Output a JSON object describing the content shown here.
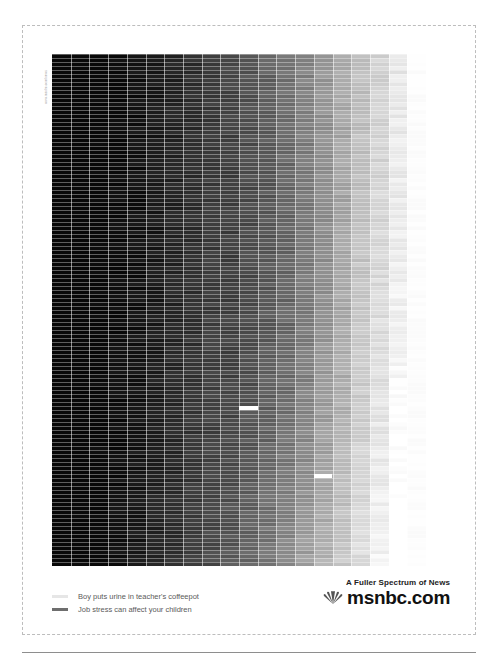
{
  "side_label": "www.msnbc.com/news",
  "grid": {
    "columns": 20,
    "rows": 128,
    "cell_width": 18.7,
    "row_height": 4,
    "gradient": "black (left) to white (right), slightly lighter toward bottom",
    "highlights": [
      {
        "name": "boy-puts-urine-in-teachers-coffeepot",
        "column": 10,
        "row": 88,
        "color": "#ffffff"
      },
      {
        "name": "job-stress-marker",
        "column": 14,
        "row": 105,
        "color": "#ffffff"
      }
    ]
  },
  "legend": {
    "items": [
      {
        "label": "Boy puts urine in teacher's coffeepot",
        "swatch_color": "#e6e6e6"
      },
      {
        "label": "Job stress can affect your children",
        "swatch_color": "#6e6e6e"
      }
    ]
  },
  "brand": {
    "tagline": "A Fuller Spectrum of News",
    "wordmark": "msnbc.com"
  }
}
